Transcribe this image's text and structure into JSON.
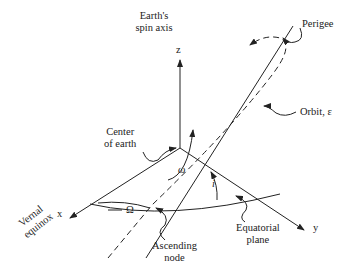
{
  "diagram": {
    "labels": {
      "spin_axis": [
        "Earth's",
        "spin axis"
      ],
      "z_axis": "z",
      "x_axis": "x",
      "y_axis": "y",
      "perigee": "Perigee",
      "orbit": "Orbit, ε",
      "center": [
        "Center",
        "of earth"
      ],
      "omega_small": "ω",
      "omega_big": "Ω",
      "inclination": "i",
      "vernal": [
        "Vernal",
        "equinox"
      ],
      "ascending_node": [
        "Ascending",
        "node"
      ],
      "equatorial_plane": [
        "Equatorial",
        "plane"
      ]
    },
    "colors": {
      "line": "#222222",
      "background": "#ffffff"
    }
  }
}
